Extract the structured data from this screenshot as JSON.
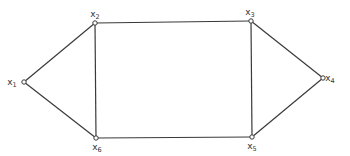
{
  "diagram": {
    "type": "graph",
    "nodes": [
      {
        "id": "x1",
        "base": "x",
        "sub": "1",
        "x": 24,
        "y": 82,
        "lx": 12,
        "ly": 85
      },
      {
        "id": "x2",
        "base": "x",
        "sub": "2",
        "x": 95,
        "y": 23,
        "lx": 95,
        "ly": 17
      },
      {
        "id": "x3",
        "base": "x",
        "sub": "3",
        "x": 251,
        "y": 21,
        "lx": 250,
        "ly": 15
      },
      {
        "id": "x4",
        "base": "x",
        "sub": "4",
        "x": 323,
        "y": 78,
        "lx": 330,
        "ly": 81
      },
      {
        "id": "x5",
        "base": "x",
        "sub": "5",
        "x": 252,
        "y": 137,
        "lx": 252,
        "ly": 149
      },
      {
        "id": "x6",
        "base": "x",
        "sub": "6",
        "x": 96,
        "y": 138,
        "lx": 97,
        "ly": 150
      }
    ],
    "edges": [
      [
        "x1",
        "x2"
      ],
      [
        "x1",
        "x6"
      ],
      [
        "x2",
        "x3"
      ],
      [
        "x2",
        "x6"
      ],
      [
        "x3",
        "x5"
      ],
      [
        "x3",
        "x4"
      ],
      [
        "x4",
        "x5"
      ],
      [
        "x6",
        "x5"
      ]
    ]
  }
}
